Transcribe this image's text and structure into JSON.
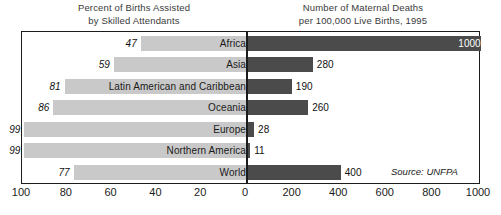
{
  "headers": {
    "left": [
      "Percent of Births Assisted",
      "by Skilled Attendants"
    ],
    "right": [
      "Number of Maternal Deaths",
      "per 100,000 Live Births, 1995"
    ]
  },
  "source": "Source: UNFPA",
  "colors": {
    "left_bar": "#c9c9c9",
    "right_bar": "#4b4b4b",
    "frame": "#1c1c1c",
    "background": "#ffffff"
  },
  "chart_data": {
    "type": "bar",
    "orientation": "horizontal",
    "layout": "diverging-bidirectional",
    "title": "",
    "categories": [
      "Africa",
      "Asia",
      "Latin American and Caribbean",
      "Oceania",
      "Europe",
      "Northern America",
      "World"
    ],
    "series": [
      {
        "name": "Percent of Births Assisted by Skilled Attendants",
        "side": "left",
        "values": [
          47,
          59,
          81,
          86,
          99,
          99,
          77
        ],
        "unit": "percent",
        "axis_direction": "right-to-left",
        "xlim": [
          0,
          100
        ],
        "ticks": [
          100,
          80,
          60,
          40,
          20,
          0
        ],
        "color": "#c9c9c9"
      },
      {
        "name": "Number of Maternal Deaths per 100,000 Live Births, 1995",
        "side": "right",
        "values": [
          1000,
          280,
          190,
          260,
          28,
          11,
          400
        ],
        "unit": "deaths per 100,000 live births",
        "axis_direction": "left-to-right",
        "xlim": [
          0,
          1000
        ],
        "ticks": [
          0,
          200,
          400,
          600,
          800,
          1000
        ],
        "color": "#4b4b4b"
      }
    ],
    "xlabel": "",
    "ylabel": "",
    "grid": false,
    "legend": "none",
    "annotations": [
      "Source: UNFPA"
    ],
    "data_labels": true
  }
}
